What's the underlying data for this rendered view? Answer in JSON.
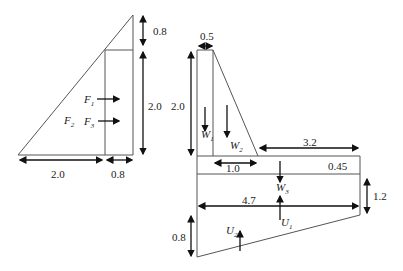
{
  "left_figure": {
    "dims": {
      "top_height": "0.8",
      "right_height": "2.0",
      "base_left": "2.0",
      "base_right": "0.8"
    },
    "forces": [
      {
        "name": "F",
        "sub": "1"
      },
      {
        "name": "F",
        "sub": "2"
      },
      {
        "name": "F",
        "sub": "3"
      }
    ]
  },
  "right_figure": {
    "dims": {
      "stem_top_width": "0.5",
      "stem_height": "2.0",
      "toe_length": "3.2",
      "heel_length": "1.0",
      "slab_thickness": "0.45",
      "total_length": "4.7",
      "right_depth": "1.2",
      "left_depth": "0.8"
    },
    "weights": [
      {
        "name": "W",
        "sub": "1"
      },
      {
        "name": "W",
        "sub": "2"
      },
      {
        "name": "W",
        "sub": "3"
      }
    ],
    "uplifts": [
      {
        "name": "U",
        "sub": "1"
      },
      {
        "name": "U",
        "sub": "2"
      }
    ]
  },
  "colors": {
    "line": "#555555",
    "arrow": "#111111",
    "text": "#222222"
  }
}
